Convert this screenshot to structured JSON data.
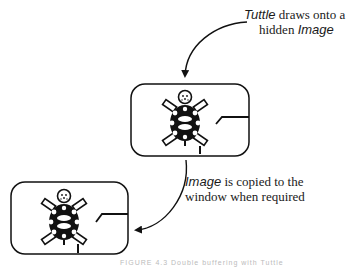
{
  "diagram": {
    "top_label": {
      "line1_italic": "Tuttle",
      "line1_rest": " draws onto a",
      "line2_plain": "hidden ",
      "line2_italic": "Image"
    },
    "middle_label": {
      "line1_italic": "Image",
      "line1_rest": " is copied to the",
      "line2_plain": "window when required"
    },
    "caption": "FIGURE 4.3   Double buffering with Tuttle",
    "boxes": [
      {
        "name": "hidden-image",
        "x": 131,
        "y": 84,
        "w": 118,
        "h": 72
      },
      {
        "name": "window",
        "x": 11,
        "y": 182,
        "w": 117,
        "h": 72
      }
    ],
    "colors": {
      "stroke": "#111111",
      "background": "#ffffff"
    }
  }
}
